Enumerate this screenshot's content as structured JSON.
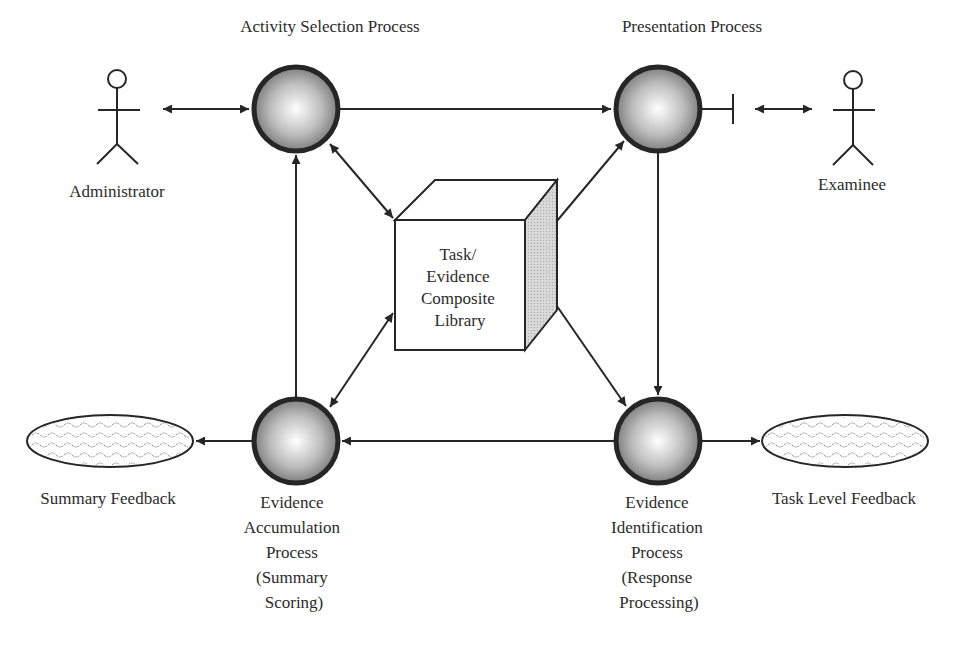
{
  "diagram": {
    "processes": {
      "activity_selection": {
        "label": [
          "Activity Selection Process"
        ]
      },
      "presentation": {
        "label": [
          "Presentation Process"
        ]
      },
      "evidence_accumulation": {
        "label": [
          "Evidence",
          "Accumulation",
          "Process",
          "(Summary",
          "Scoring)"
        ]
      },
      "evidence_identification": {
        "label": [
          "Evidence",
          "Identification",
          "Process",
          "(Response",
          "Processing)"
        ]
      }
    },
    "library": {
      "label": [
        "Task/",
        "Evidence",
        "Composite",
        "Library"
      ]
    },
    "actors": {
      "administrator": {
        "label": "Administrator"
      },
      "examinee": {
        "label": "Examinee"
      }
    },
    "feedback": {
      "summary": {
        "label": "Summary Feedback"
      },
      "task_level": {
        "label": "Task Level Feedback"
      }
    },
    "connections": [
      {
        "from": "administrator",
        "to": "activity_selection",
        "type": "bidirectional"
      },
      {
        "from": "activity_selection",
        "to": "presentation",
        "type": "directed"
      },
      {
        "from": "presentation",
        "to": "examinee",
        "type": "bidirectional"
      },
      {
        "from": "presentation",
        "to": "evidence_identification",
        "type": "directed"
      },
      {
        "from": "evidence_identification",
        "to": "evidence_accumulation",
        "type": "directed"
      },
      {
        "from": "evidence_accumulation",
        "to": "activity_selection",
        "type": "directed"
      },
      {
        "from": "evidence_accumulation",
        "to": "summary_feedback",
        "type": "directed"
      },
      {
        "from": "evidence_identification",
        "to": "task_level_feedback",
        "type": "directed"
      },
      {
        "from": "library",
        "to": "activity_selection",
        "type": "bidirectional"
      },
      {
        "from": "library",
        "to": "presentation",
        "type": "bidirectional"
      },
      {
        "from": "library",
        "to": "evidence_accumulation",
        "type": "bidirectional"
      },
      {
        "from": "library",
        "to": "evidence_identification",
        "type": "bidirectional"
      }
    ],
    "colors": {
      "stroke": "#262626",
      "sphere_light": "#ffffff",
      "sphere_dark": "#6e6e6e",
      "box_side": "#cfcfcf",
      "text": "#2b2b2b"
    }
  }
}
